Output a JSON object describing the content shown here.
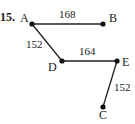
{
  "problem_number": "15.",
  "graph": {
    "nodes": [
      {
        "id": "A",
        "label": "A",
        "x": 32,
        "y": 24,
        "lx": 20,
        "ly": 22
      },
      {
        "id": "B",
        "label": "B",
        "x": 103,
        "y": 24,
        "lx": 109,
        "ly": 22
      },
      {
        "id": "D",
        "label": "D",
        "x": 62,
        "y": 61,
        "lx": 48,
        "ly": 71
      },
      {
        "id": "E",
        "label": "E",
        "x": 117,
        "y": 61,
        "lx": 122,
        "ly": 66
      },
      {
        "id": "C",
        "label": "C",
        "x": 103,
        "y": 107,
        "lx": 99,
        "ly": 119
      }
    ],
    "edges": [
      {
        "from": "A",
        "to": "B",
        "weight": "168",
        "lx": 59,
        "ly": 18
      },
      {
        "from": "A",
        "to": "D",
        "weight": "152",
        "lx": 26,
        "ly": 48
      },
      {
        "from": "D",
        "to": "E",
        "weight": "164",
        "lx": 79,
        "ly": 55
      },
      {
        "from": "E",
        "to": "C",
        "weight": "152",
        "lx": 114,
        "ly": 91
      }
    ]
  },
  "colors": {
    "edge": "#222222",
    "node": "#111111",
    "text": "#1a1a1a"
  }
}
